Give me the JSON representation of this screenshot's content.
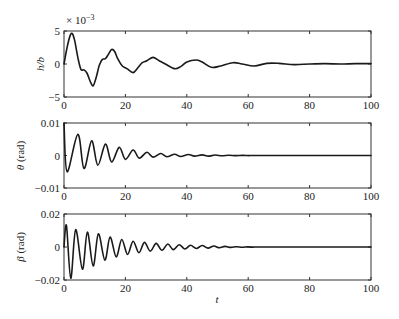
{
  "chart_data": [
    {
      "type": "line",
      "id": "hb",
      "title": "",
      "ylabel": "h/b",
      "ylabel_unit": "",
      "xlabel": "",
      "multiplier_label": "× 10",
      "multiplier_exp": "−3",
      "xlim": [
        0,
        100
      ],
      "ylim": [
        -5,
        5
      ],
      "xticks": [
        0,
        20,
        40,
        60,
        80,
        100
      ],
      "xtick_labels": [
        "0",
        "20",
        "40",
        "60",
        "80",
        "100"
      ],
      "yticks": [
        -5,
        0,
        5
      ],
      "ytick_labels": [
        "−5",
        "0",
        "5"
      ],
      "grid": false,
      "series": [
        {
          "name": "h/b (×10^-3)",
          "x": [
            0,
            1,
            2,
            2.7,
            3.5,
            4.5,
            5.5,
            6.5,
            7.5,
            8.5,
            9.5,
            10.5,
            11.5,
            12.5,
            13.5,
            14.5,
            15.5,
            16.5,
            17.5,
            19,
            20.5,
            22.5,
            24,
            25.5,
            27,
            29,
            31,
            33,
            36,
            38,
            40,
            43,
            45,
            48,
            51,
            55,
            58,
            62,
            66,
            70,
            75,
            80,
            85,
            90,
            95,
            100
          ],
          "values": [
            0,
            2.5,
            4.3,
            4.6,
            3.5,
            1.0,
            -0.8,
            -0.9,
            -1.4,
            -2.6,
            -3.3,
            -2.0,
            -0.2,
            0.7,
            0.8,
            1.5,
            2.2,
            1.9,
            0.8,
            -0.3,
            -0.7,
            -1.3,
            -0.6,
            0.2,
            0.5,
            1.0,
            0.5,
            0.0,
            -0.7,
            -0.4,
            0.3,
            0.6,
            0.3,
            -0.5,
            -0.3,
            0.2,
            0.0,
            -0.3,
            0.1,
            0.1,
            -0.1,
            0.0,
            0.05,
            0.0,
            0.05,
            0.05
          ]
        }
      ]
    },
    {
      "type": "line",
      "id": "theta",
      "title": "",
      "ylabel": "θ",
      "ylabel_unit": " (rad)",
      "xlabel": "",
      "xlim": [
        0,
        100
      ],
      "ylim": [
        -0.01,
        0.01
      ],
      "xticks": [
        0,
        20,
        40,
        60,
        80,
        100
      ],
      "xtick_labels": [
        "0",
        "20",
        "40",
        "60",
        "80",
        "100"
      ],
      "yticks": [
        -0.01,
        0,
        0.01
      ],
      "ytick_labels": [
        "−0.01",
        "0",
        "0.01"
      ],
      "grid": false,
      "series": [
        {
          "name": "θ (rad)",
          "decay_oscillation": {
            "initial": 0.01,
            "first_trough": {
              "t": 1.0,
              "value": -0.005
            },
            "peaks": [
              [
                4.5,
                0.0065
              ],
              [
                9.0,
                0.0045
              ],
              [
                13.5,
                0.0035
              ],
              [
                18.0,
                0.0025
              ],
              [
                22.5,
                0.0017
              ],
              [
                27.0,
                0.001
              ],
              [
                31.5,
                0.0006
              ],
              [
                36.0,
                0.0004
              ],
              [
                40.5,
                0.0003
              ],
              [
                45.0,
                0.0002
              ]
            ],
            "troughs": [
              [
                6.5,
                -0.004
              ],
              [
                11.0,
                -0.003
              ],
              [
                15.5,
                -0.002
              ],
              [
                20.0,
                -0.0012
              ],
              [
                24.5,
                -0.0008
              ],
              [
                29.0,
                -0.0005
              ],
              [
                33.5,
                -0.0004
              ],
              [
                38.0,
                -0.0003
              ],
              [
                42.5,
                -0.0002
              ],
              [
                47.0,
                -0.0002
              ]
            ],
            "settles_to": 0.0,
            "settle_t": 60
          }
        }
      ]
    },
    {
      "type": "line",
      "id": "beta",
      "title": "",
      "ylabel": "β",
      "ylabel_unit": " (rad)",
      "xlabel": "t",
      "xlim": [
        0,
        100
      ],
      "ylim": [
        -0.02,
        0.02
      ],
      "xticks": [
        0,
        20,
        40,
        60,
        80,
        100
      ],
      "xtick_labels": [
        "0",
        "20",
        "40",
        "60",
        "80",
        "100"
      ],
      "yticks": [
        -0.02,
        0,
        0.02
      ],
      "ytick_labels": [
        "−0.02",
        "0",
        "0.02"
      ],
      "grid": false,
      "series": [
        {
          "name": "β (rad)",
          "decay_oscillation": {
            "initial": 0.0,
            "peaks": [
              [
                0.8,
                0.013
              ],
              [
                3.8,
                0.0105
              ],
              [
                7.6,
                0.009
              ],
              [
                11.2,
                0.008
              ],
              [
                15.0,
                0.006
              ],
              [
                18.8,
                0.0045
              ],
              [
                22.5,
                0.0035
              ],
              [
                26.2,
                0.0028
              ],
              [
                30.0,
                0.0022
              ],
              [
                33.8,
                0.0018
              ],
              [
                37.5,
                0.0014
              ],
              [
                41.2,
                0.0011
              ],
              [
                45.0,
                0.0009
              ],
              [
                48.8,
                0.0006
              ]
            ],
            "troughs": [
              [
                2.2,
                -0.019
              ],
              [
                6.0,
                -0.0135
              ],
              [
                9.5,
                -0.0115
              ],
              [
                13.3,
                -0.008
              ],
              [
                17.0,
                -0.006
              ],
              [
                20.7,
                -0.0045
              ],
              [
                24.4,
                -0.0035
              ],
              [
                28.1,
                -0.0025
              ],
              [
                31.9,
                -0.002
              ],
              [
                35.6,
                -0.0016
              ],
              [
                39.4,
                -0.0012
              ],
              [
                43.1,
                -0.0009
              ],
              [
                46.9,
                -0.0007
              ],
              [
                50.6,
                -0.0005
              ]
            ],
            "settles_to": 0.0,
            "settle_t": 60
          }
        }
      ]
    }
  ],
  "layout": {
    "plot_left": 64,
    "plot_right": 371,
    "panels": [
      {
        "top": 31,
        "bottom": 97
      },
      {
        "top": 123,
        "bottom": 188
      },
      {
        "top": 214,
        "bottom": 280
      }
    ]
  }
}
